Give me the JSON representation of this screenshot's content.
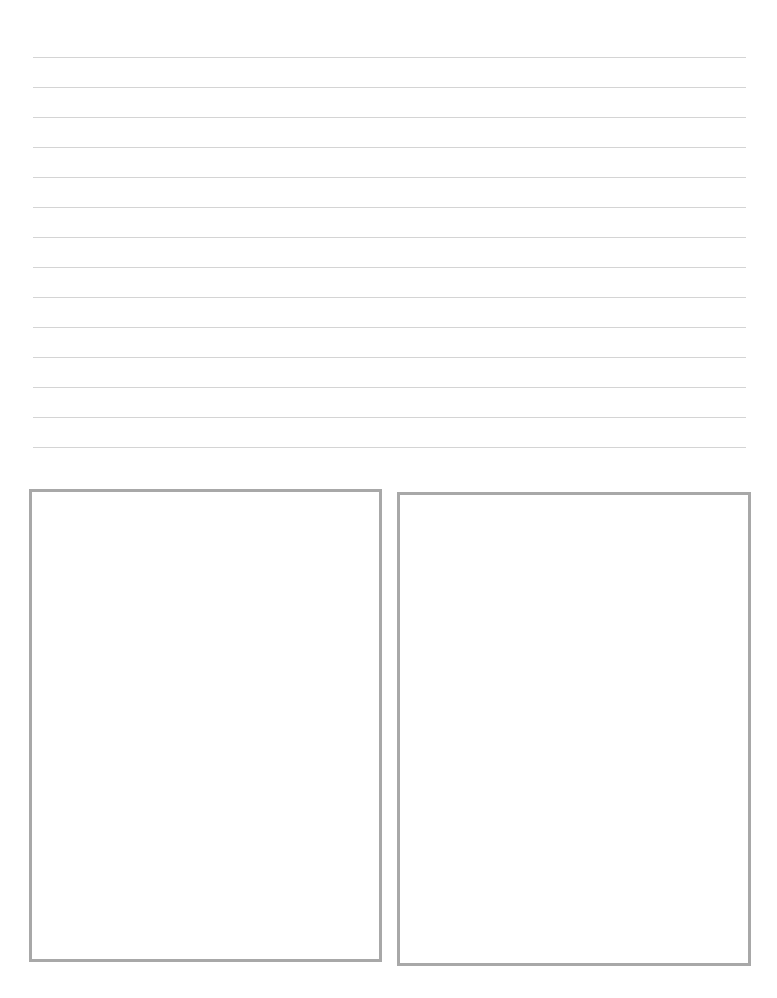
{
  "page": {
    "type": "blank worksheet",
    "ruled_lines": {
      "count": 14,
      "color": "#d4d4d4"
    },
    "boxes": [
      {
        "id": "left",
        "border_color": "#a8a8a8",
        "content": ""
      },
      {
        "id": "right",
        "border_color": "#a8a8a8",
        "content": ""
      }
    ]
  }
}
